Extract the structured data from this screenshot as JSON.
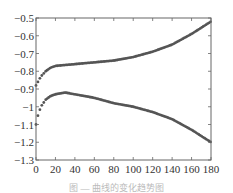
{
  "chart_data": {
    "type": "scatter",
    "title": "",
    "xlabel": "",
    "ylabel": "",
    "xlim": [
      0,
      180
    ],
    "ylim": [
      -1.3,
      -0.5
    ],
    "x_ticks": [
      0,
      20,
      40,
      60,
      80,
      100,
      120,
      140,
      160,
      180
    ],
    "y_ticks": [
      -0.5,
      -0.6,
      -0.7,
      -0.8,
      -0.9,
      -1,
      -1.1,
      -1.2,
      -1.3
    ],
    "grid": false,
    "legend": null,
    "marker_color": "#555555",
    "series": [
      {
        "name": "upper",
        "x": [
          0,
          2,
          5,
          10,
          15,
          20,
          30,
          40,
          60,
          80,
          100,
          120,
          140,
          160,
          180
        ],
        "values": [
          -0.88,
          -0.86,
          -0.83,
          -0.8,
          -0.78,
          -0.77,
          -0.765,
          -0.76,
          -0.75,
          -0.74,
          -0.72,
          -0.69,
          -0.65,
          -0.59,
          -0.52
        ]
      },
      {
        "name": "lower",
        "x": [
          0,
          2,
          5,
          10,
          15,
          20,
          30,
          40,
          60,
          80,
          100,
          120,
          140,
          160,
          180
        ],
        "values": [
          -1.1,
          -1.05,
          -1.0,
          -0.96,
          -0.94,
          -0.93,
          -0.92,
          -0.93,
          -0.95,
          -0.98,
          -1.0,
          -1.03,
          -1.07,
          -1.13,
          -1.2
        ]
      }
    ]
  },
  "caption": "图 — 曲线的变化趋势图"
}
